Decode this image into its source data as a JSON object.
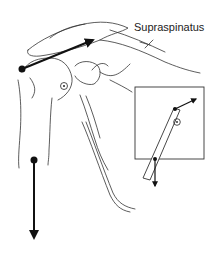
{
  "figure": {
    "label": "Supraspinatus",
    "colors": {
      "ink": "#111111",
      "outline": "#333333",
      "background": "#ffffff"
    },
    "main": {
      "vectors": [
        "supraspinatus-force-vector",
        "arm-weight-vector"
      ],
      "markers": [
        "muscle-insertion-point",
        "center-of-rotation",
        "arm-center-of-mass"
      ]
    },
    "inset": {
      "vectors": [
        "inset-muscle-force-vector",
        "inset-weight-vector"
      ],
      "markers": [
        "inset-insertion-point",
        "inset-center-of-rotation",
        "inset-center-of-mass"
      ]
    }
  }
}
